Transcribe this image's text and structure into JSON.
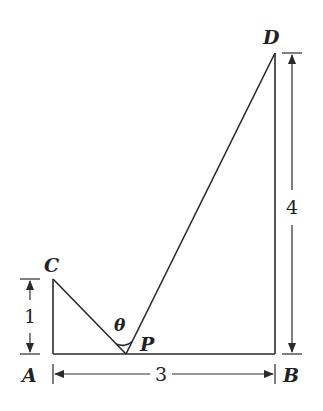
{
  "diagram": {
    "points": {
      "A": {
        "label": "A"
      },
      "B": {
        "label": "B"
      },
      "C": {
        "label": "C"
      },
      "D": {
        "label": "D"
      },
      "P": {
        "label": "P"
      }
    },
    "angle_label": "θ",
    "dimensions": {
      "AC": "1",
      "AB": "3",
      "BD": "4"
    },
    "colors": {
      "line": "#2a2a2a",
      "background": "#ffffff"
    }
  }
}
